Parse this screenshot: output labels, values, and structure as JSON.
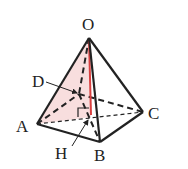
{
  "diagram": {
    "type": "pyramid",
    "vertices": {
      "O": {
        "label": "O",
        "x": 89,
        "y": 38
      },
      "A": {
        "label": "A",
        "x": 37,
        "y": 124
      },
      "B": {
        "label": "B",
        "x": 100,
        "y": 142
      },
      "C": {
        "label": "C",
        "x": 143,
        "y": 112
      },
      "D": {
        "label": "D",
        "x": 79,
        "y": 94
      },
      "H": {
        "label": "H",
        "x": 91,
        "y": 117
      }
    },
    "colors": {
      "edge": "#222222",
      "highlight_fill": "#f8dede",
      "height_line": "#d94040"
    }
  }
}
